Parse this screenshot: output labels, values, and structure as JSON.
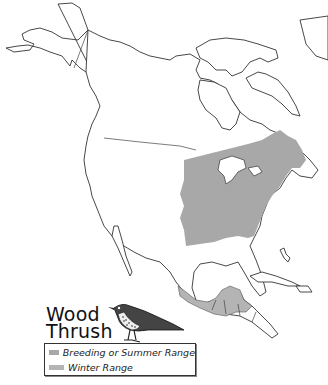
{
  "map": {
    "title_line1": "Wood",
    "title_line2": "Thrush",
    "subject": "Wood Thrush range map of North America",
    "region": "North America",
    "legend": [
      {
        "label": "Breeding or Summer Range",
        "color": "#a8a8a8"
      },
      {
        "label": "Winter Range",
        "color": "#b4b4b4"
      }
    ],
    "illustration": "wood-thrush-bird"
  }
}
